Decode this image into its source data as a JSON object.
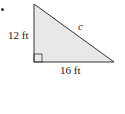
{
  "figure": {
    "shape": "right-triangle",
    "fill_color": "#e8e8e8",
    "stroke_color": "#333333",
    "labels": {
      "vertical_leg": "12 ft",
      "horizontal_leg": "16 ft",
      "hypotenuse": "c"
    },
    "right_angle_marker": true
  }
}
